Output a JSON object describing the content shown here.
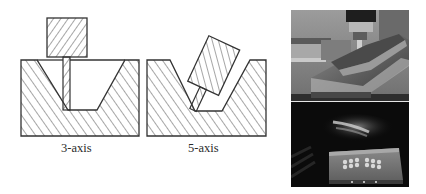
{
  "figure": {
    "panels": [
      {
        "id": "three-axis",
        "label": "3-axis"
      },
      {
        "id": "five-axis",
        "label": "5-axis"
      }
    ],
    "photos": [
      {
        "id": "top-photo",
        "description": "5-axis machining of a sloped workpiece (photo)"
      },
      {
        "id": "bottom-photo",
        "description": "Machined part with multiple pockets (photo)"
      }
    ],
    "colors": {
      "line": "#333333",
      "background": "#ffffff",
      "hatch": "#3a3a3a"
    }
  }
}
